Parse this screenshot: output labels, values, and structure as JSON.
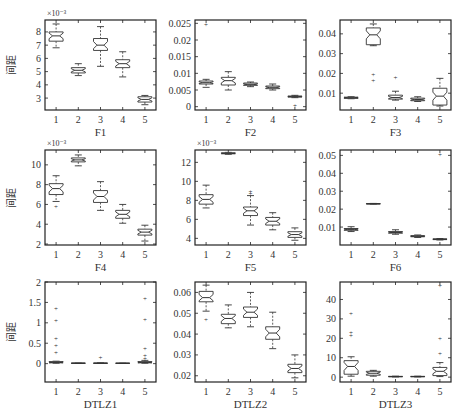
{
  "figure": {
    "ylabel_common": "间距",
    "xtick_labels": [
      "1",
      "2",
      "3",
      "4",
      "5"
    ]
  },
  "chart_data": [
    {
      "type": "boxplot",
      "title": "F1",
      "xlabel": "F1",
      "ylabel": "间距",
      "exponent": "×10⁻³",
      "ylim": [
        2.1,
        8.9
      ],
      "yticks": [
        3,
        4,
        5,
        6,
        7,
        8
      ],
      "ytick_labels": [
        "3",
        "4",
        "5",
        "6",
        "7",
        "8"
      ],
      "categories": [
        "1",
        "2",
        "3",
        "4",
        "5"
      ],
      "boxes": [
        {
          "wlo": 6.8,
          "q1": 7.3,
          "med": 7.7,
          "q3": 8.0,
          "whi": 8.6,
          "out": []
        },
        {
          "wlo": 4.7,
          "q1": 4.9,
          "med": 5.1,
          "q3": 5.3,
          "whi": 5.6,
          "out": []
        },
        {
          "wlo": 5.4,
          "q1": 6.6,
          "med": 7.0,
          "q3": 7.5,
          "whi": 8.4,
          "out": []
        },
        {
          "wlo": 4.6,
          "q1": 5.3,
          "med": 5.6,
          "q3": 5.9,
          "whi": 6.5,
          "out": []
        },
        {
          "wlo": 2.5,
          "q1": 2.7,
          "med": 2.9,
          "q3": 3.1,
          "whi": 3.2,
          "out": []
        }
      ]
    },
    {
      "type": "boxplot",
      "title": "F2",
      "xlabel": "F2",
      "ylabel": "",
      "exponent": "",
      "ylim": [
        -0.001,
        0.026
      ],
      "yticks": [
        0,
        0.005,
        0.01,
        0.015,
        0.02,
        0.025
      ],
      "ytick_labels": [
        "0",
        "0.005",
        "0.01",
        "0.015",
        "0.02",
        "0.025"
      ],
      "categories": [
        "1",
        "2",
        "3",
        "4",
        "5"
      ],
      "boxes": [
        {
          "wlo": 0.0058,
          "q1": 0.0068,
          "med": 0.0072,
          "q3": 0.0077,
          "whi": 0.0082,
          "out": [
            0.0248
          ]
        },
        {
          "wlo": 0.005,
          "q1": 0.0065,
          "med": 0.0078,
          "q3": 0.0088,
          "whi": 0.0105,
          "out": []
        },
        {
          "wlo": 0.006,
          "q1": 0.0064,
          "med": 0.0067,
          "q3": 0.0071,
          "whi": 0.0074,
          "out": []
        },
        {
          "wlo": 0.005,
          "q1": 0.0054,
          "med": 0.0058,
          "q3": 0.0062,
          "whi": 0.0068,
          "out": []
        },
        {
          "wlo": 0.0027,
          "q1": 0.0029,
          "med": 0.003,
          "q3": 0.0032,
          "whi": 0.0034,
          "out": [
            0.0005
          ]
        }
      ]
    },
    {
      "type": "boxplot",
      "title": "F3",
      "xlabel": "F3",
      "ylabel": "",
      "exponent": "",
      "ylim": [
        0.0015,
        0.047
      ],
      "yticks": [
        0.01,
        0.02,
        0.03,
        0.04
      ],
      "ytick_labels": [
        "0.01",
        "0.02",
        "0.03",
        "0.04"
      ],
      "categories": [
        "1",
        "2",
        "3",
        "4",
        "5"
      ],
      "boxes": [
        {
          "wlo": 0.0072,
          "q1": 0.0074,
          "med": 0.0077,
          "q3": 0.008,
          "whi": 0.0082,
          "out": []
        },
        {
          "wlo": 0.034,
          "q1": 0.0345,
          "med": 0.0395,
          "q3": 0.043,
          "whi": 0.045,
          "out": [
            0.0195,
            0.0165
          ]
        },
        {
          "wlo": 0.0065,
          "q1": 0.007,
          "med": 0.0078,
          "q3": 0.009,
          "whi": 0.011,
          "out": [
            0.018
          ]
        },
        {
          "wlo": 0.0058,
          "q1": 0.0062,
          "med": 0.0068,
          "q3": 0.0075,
          "whi": 0.0082,
          "out": []
        },
        {
          "wlo": 0.0035,
          "q1": 0.004,
          "med": 0.0085,
          "q3": 0.0125,
          "whi": 0.0175,
          "out": []
        }
      ]
    },
    {
      "type": "boxplot",
      "title": "F4",
      "xlabel": "F4",
      "ylabel": "间距",
      "exponent": "×10⁻³",
      "ylim": [
        1.9,
        11.5
      ],
      "yticks": [
        2,
        4,
        6,
        8,
        10
      ],
      "ytick_labels": [
        "2",
        "4",
        "6",
        "8",
        "10"
      ],
      "categories": [
        "1",
        "2",
        "3",
        "4",
        "5"
      ],
      "boxes": [
        {
          "wlo": 6.3,
          "q1": 7.0,
          "med": 7.6,
          "q3": 8.1,
          "whi": 8.9,
          "out": [
            5.8
          ]
        },
        {
          "wlo": 9.9,
          "q1": 10.3,
          "med": 10.5,
          "q3": 10.7,
          "whi": 11.0,
          "out": []
        },
        {
          "wlo": 5.4,
          "q1": 6.2,
          "med": 6.8,
          "q3": 7.4,
          "whi": 8.3,
          "out": []
        },
        {
          "wlo": 4.1,
          "q1": 4.6,
          "med": 5.0,
          "q3": 5.4,
          "whi": 6.0,
          "out": []
        },
        {
          "wlo": 2.3,
          "q1": 2.9,
          "med": 3.2,
          "q3": 3.5,
          "whi": 3.9,
          "out": []
        }
      ]
    },
    {
      "type": "boxplot",
      "title": "F5",
      "xlabel": "F5",
      "ylabel": "",
      "exponent": "×10⁻³",
      "ylim": [
        3.3,
        13.3
      ],
      "yticks": [
        4,
        6,
        8,
        10,
        12
      ],
      "ytick_labels": [
        "4",
        "6",
        "8",
        "10",
        "12"
      ],
      "categories": [
        "1",
        "2",
        "3",
        "4",
        "5"
      ],
      "boxes": [
        {
          "wlo": 7.2,
          "q1": 7.6,
          "med": 8.1,
          "q3": 8.6,
          "whi": 9.6,
          "out": []
        },
        {
          "wlo": 12.85,
          "q1": 12.9,
          "med": 12.95,
          "q3": 13.0,
          "whi": 13.05,
          "out": []
        },
        {
          "wlo": 5.4,
          "q1": 6.4,
          "med": 6.9,
          "q3": 7.3,
          "whi": 8.5,
          "out": [
            8.9,
            8.7
          ]
        },
        {
          "wlo": 4.9,
          "q1": 5.4,
          "med": 5.8,
          "q3": 6.2,
          "whi": 6.7,
          "out": []
        },
        {
          "wlo": 3.8,
          "q1": 4.1,
          "med": 4.4,
          "q3": 4.7,
          "whi": 5.1,
          "out": []
        }
      ]
    },
    {
      "type": "boxplot",
      "title": "F6",
      "xlabel": "F6",
      "ylabel": "",
      "exponent": "",
      "ylim": [
        0.0,
        0.053
      ],
      "yticks": [
        0.01,
        0.02,
        0.03,
        0.04,
        0.05
      ],
      "ytick_labels": [
        "0.01",
        "0.02",
        "0.03",
        "0.04",
        "0.05"
      ],
      "categories": [
        "1",
        "2",
        "3",
        "4",
        "5"
      ],
      "boxes": [
        {
          "wlo": 0.0075,
          "q1": 0.0082,
          "med": 0.0087,
          "q3": 0.0092,
          "whi": 0.0102,
          "out": []
        },
        {
          "wlo": 0.0228,
          "q1": 0.0229,
          "med": 0.023,
          "q3": 0.0231,
          "whi": 0.0232,
          "out": []
        },
        {
          "wlo": 0.006,
          "q1": 0.0066,
          "med": 0.007,
          "q3": 0.0075,
          "whi": 0.0085,
          "out": []
        },
        {
          "wlo": 0.0042,
          "q1": 0.0046,
          "med": 0.0049,
          "q3": 0.0052,
          "whi": 0.0056,
          "out": []
        },
        {
          "wlo": 0.0028,
          "q1": 0.003,
          "med": 0.0032,
          "q3": 0.0034,
          "whi": 0.0036,
          "out": [
            0.0505
          ]
        }
      ]
    },
    {
      "type": "boxplot",
      "title": "DTLZ1",
      "xlabel": "DTLZ1",
      "ylabel": "间距",
      "exponent": "",
      "ylim": [
        -0.45,
        2.0
      ],
      "yticks": [
        0,
        0.5,
        1,
        1.5,
        2
      ],
      "ytick_labels": [
        "0",
        "0.5",
        "1",
        "1.5",
        "2"
      ],
      "categories": [
        "1",
        "2",
        "3",
        "4",
        "5"
      ],
      "boxes": [
        {
          "wlo": 0.01,
          "q1": 0.02,
          "med": 0.03,
          "q3": 0.05,
          "whi": 0.06,
          "out": [
            1.35,
            1.05,
            0.62,
            0.45,
            0.28
          ]
        },
        {
          "wlo": 0.005,
          "q1": 0.008,
          "med": 0.01,
          "q3": 0.012,
          "whi": 0.015,
          "out": []
        },
        {
          "wlo": 0.005,
          "q1": 0.008,
          "med": 0.01,
          "q3": 0.013,
          "whi": 0.02,
          "out": [
            0.15
          ]
        },
        {
          "wlo": 0.004,
          "q1": 0.007,
          "med": 0.009,
          "q3": 0.011,
          "whi": 0.014,
          "out": []
        },
        {
          "wlo": 0.01,
          "q1": 0.02,
          "med": 0.03,
          "q3": 0.05,
          "whi": 0.08,
          "out": [
            1.6,
            1.08,
            0.38,
            0.2,
            0.12
          ]
        }
      ]
    },
    {
      "type": "boxplot",
      "title": "DTLZ2",
      "xlabel": "DTLZ2",
      "ylabel": "",
      "exponent": "",
      "ylim": [
        0.017,
        0.065
      ],
      "yticks": [
        0.02,
        0.03,
        0.04,
        0.05,
        0.06
      ],
      "ytick_labels": [
        "0.02",
        "0.03",
        "0.04",
        "0.05",
        "0.06"
      ],
      "categories": [
        "1",
        "2",
        "3",
        "4",
        "5"
      ],
      "boxes": [
        {
          "wlo": 0.051,
          "q1": 0.0555,
          "med": 0.0575,
          "q3": 0.0605,
          "whi": 0.0635,
          "out": [
            0.047
          ]
        },
        {
          "wlo": 0.043,
          "q1": 0.045,
          "med": 0.0475,
          "q3": 0.0495,
          "whi": 0.054,
          "out": []
        },
        {
          "wlo": 0.0435,
          "q1": 0.048,
          "med": 0.0505,
          "q3": 0.053,
          "whi": 0.06,
          "out": []
        },
        {
          "wlo": 0.033,
          "q1": 0.0375,
          "med": 0.0405,
          "q3": 0.0435,
          "whi": 0.0505,
          "out": []
        },
        {
          "wlo": 0.019,
          "q1": 0.0215,
          "med": 0.0235,
          "q3": 0.0255,
          "whi": 0.03,
          "out": []
        }
      ]
    },
    {
      "type": "boxplot",
      "title": "DTLZ3",
      "xlabel": "DTLZ3",
      "ylabel": "",
      "exponent": "",
      "ylim": [
        -2.5,
        49
      ],
      "yticks": [
        0,
        10,
        20,
        30,
        40
      ],
      "ytick_labels": [
        "0",
        "10",
        "20",
        "30",
        "40"
      ],
      "categories": [
        "1",
        "2",
        "3",
        "4",
        "5"
      ],
      "boxes": [
        {
          "wlo": 0.5,
          "q1": 1.5,
          "med": 5.5,
          "q3": 8.5,
          "whi": 10.5,
          "out": [
            33,
            23,
            21.5
          ]
        },
        {
          "wlo": 0.5,
          "q1": 1.0,
          "med": 2.0,
          "q3": 3.0,
          "whi": 3.5,
          "out": []
        },
        {
          "wlo": 0.1,
          "q1": 0.2,
          "med": 0.3,
          "q3": 0.4,
          "whi": 0.5,
          "out": []
        },
        {
          "wlo": 0.1,
          "q1": 0.2,
          "med": 0.3,
          "q3": 0.4,
          "whi": 0.5,
          "out": []
        },
        {
          "wlo": 0.3,
          "q1": 0.8,
          "med": 3.0,
          "q3": 5.0,
          "whi": 7.5,
          "out": [
            47,
            20,
            12
          ]
        }
      ]
    }
  ]
}
